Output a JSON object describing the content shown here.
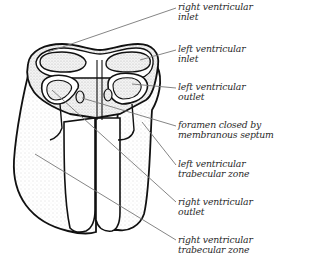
{
  "figure": {
    "colors": {
      "outline": "#111111",
      "leader_line": "#777777",
      "stipple": "#c8c8c8",
      "label_text": "#2a2a2a"
    },
    "labels": [
      {
        "id": "rv-inlet",
        "line1": "right ventricular",
        "line2": "inlet",
        "top": 2
      },
      {
        "id": "lv-inlet",
        "line1": "left ventricular",
        "line2": "inlet",
        "top": 44
      },
      {
        "id": "lv-outlet",
        "line1": "left ventricular",
        "line2": "outlet",
        "top": 82
      },
      {
        "id": "foramen",
        "line1": "foramen closed by",
        "line2": "membranous septum",
        "top": 120
      },
      {
        "id": "lv-trabecular",
        "line1": "left ventricular",
        "line2": "trabecular zone",
        "top": 159
      },
      {
        "id": "rv-outlet",
        "line1": "right ventricular",
        "line2": "outlet",
        "top": 197
      },
      {
        "id": "rv-trabecular",
        "line1": "right ventricular",
        "line2": "trabecular zone",
        "top": 235
      }
    ]
  }
}
